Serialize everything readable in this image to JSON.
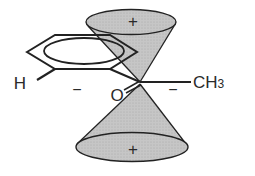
{
  "diagram": {
    "labels": {
      "top_sign": "+",
      "bottom_sign": "+",
      "left_sign": "−",
      "right_sign": "−",
      "hydrogen": "H",
      "oxygen": "O",
      "methyl": "CH",
      "methyl_subscript": "3"
    },
    "colors": {
      "cone_fill": "#c4c4c4",
      "ellipse_fill": "#b8b8b8",
      "stroke": "#222222",
      "background": "#ffffff"
    }
  }
}
